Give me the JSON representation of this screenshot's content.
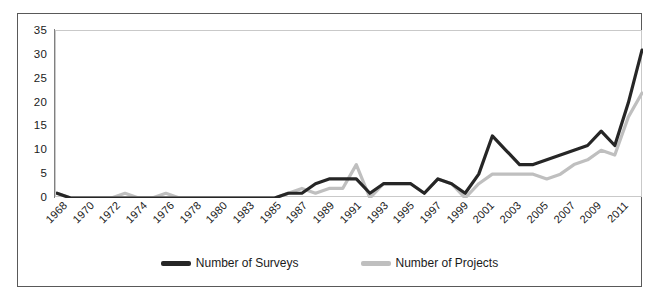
{
  "chart_data": {
    "type": "line",
    "title": "",
    "subtitle": "",
    "xlabel": "",
    "ylabel": "",
    "grid": false,
    "legend_position": "bottom-center",
    "ylim": [
      0,
      35
    ],
    "yticks": [
      0,
      5,
      10,
      15,
      20,
      25,
      30,
      35
    ],
    "categories": [
      "1968",
      "1969",
      "1970",
      "1971",
      "1972",
      "1973",
      "1974",
      "1975",
      "1976",
      "1977",
      "1978",
      "1979",
      "1980",
      "1982",
      "1983",
      "1984",
      "1985",
      "1986",
      "1987",
      "1988",
      "1989",
      "1990",
      "1991",
      "1992",
      "1993",
      "1994",
      "1995",
      "1996",
      "1997",
      "1998",
      "1999",
      "2000",
      "2001",
      "2002",
      "2003",
      "2004",
      "2005",
      "2006",
      "2007",
      "2008",
      "2009",
      "2010",
      "2011",
      "2012"
    ],
    "xtick_labels": [
      "1968",
      "1970",
      "1972",
      "1974",
      "1976",
      "1978",
      "1980",
      "1983",
      "1985",
      "1987",
      "1989",
      "1991",
      "1993",
      "1995",
      "1997",
      "1999",
      "2001",
      "2003",
      "2005",
      "2007",
      "2009",
      "2011"
    ],
    "series": [
      {
        "name": "Number of Surveys",
        "color": "#262626",
        "values": [
          1,
          0,
          0,
          0,
          0,
          0,
          0,
          0,
          0,
          0,
          0,
          0,
          0,
          0,
          0,
          0,
          0,
          1,
          1,
          3,
          4,
          4,
          4,
          1,
          3,
          3,
          3,
          1,
          4,
          3,
          1,
          5,
          13,
          10,
          7,
          7,
          8,
          9,
          10,
          11,
          14,
          11,
          20,
          31
        ]
      },
      {
        "name": "Number of Projects",
        "color": "#bfbfbf",
        "values": [
          1,
          0,
          0,
          0,
          0,
          1,
          0,
          0,
          1,
          0,
          0,
          0,
          0,
          0,
          0,
          0,
          0,
          1,
          2,
          1,
          2,
          2,
          7,
          0,
          3,
          3,
          3,
          1,
          4,
          3,
          0,
          3,
          5,
          5,
          5,
          5,
          4,
          5,
          7,
          8,
          10,
          9,
          17,
          22
        ]
      }
    ]
  },
  "legend": {
    "entries": [
      {
        "label": "Number of Surveys",
        "color": "#262626"
      },
      {
        "label": "Number of Projects",
        "color": "#bfbfbf"
      }
    ]
  }
}
